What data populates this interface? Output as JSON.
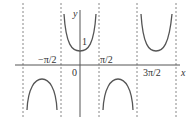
{
  "figure": {
    "function": "y = sec x",
    "axis_labels": {
      "x": "x",
      "y": "y"
    },
    "tick_labels": {
      "neg_pi_over_2": "−π/2",
      "zero": "0",
      "pi_over_2": "π/2",
      "three_pi_over_2": "3π/2",
      "one": "1"
    },
    "asymptotes": [
      "−3π/2",
      "−π/2",
      "π/2",
      "3π/2",
      "5π/2"
    ],
    "colors": {
      "curve": "#555555",
      "axis": "#555555",
      "asymptote": "#888888"
    }
  }
}
